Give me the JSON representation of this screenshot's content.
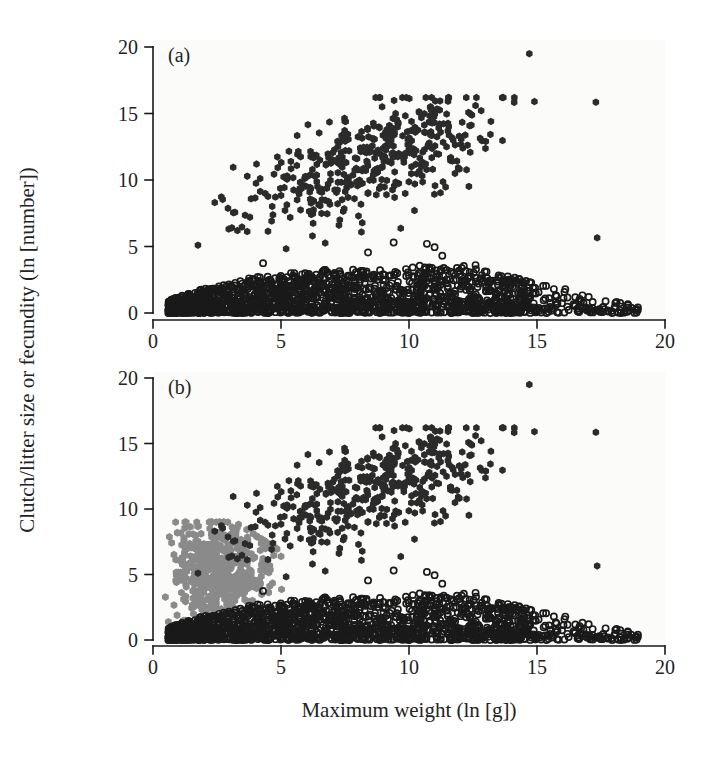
{
  "figure": {
    "background_color": "#ffffff",
    "panel_background_color": "#fbfbf9",
    "axis_color": "#1a1a1a",
    "width": 712,
    "height": 760
  },
  "axes": {
    "x_title": "Maximum weight (ln [g])",
    "y_title": "Clutch/litter size or fecundity (ln [number])",
    "x_ticks": [
      "0",
      "5",
      "10",
      "15",
      "20"
    ],
    "y_ticks": [
      "0",
      "5",
      "10",
      "15",
      "20"
    ],
    "x_tick_values": [
      0,
      5,
      10,
      15,
      20
    ],
    "y_tick_values": [
      0,
      5,
      10,
      15,
      20
    ],
    "xlim": [
      0,
      20
    ],
    "ylim": [
      0,
      20
    ],
    "grid": false
  },
  "panels": [
    {
      "tag": "(a)",
      "pixel_left": 153,
      "pixel_right": 665,
      "pixel_top": 47,
      "pixel_bottom": 313,
      "axis_y": 320,
      "series_names": [
        "filled-dark-fecundity",
        "open-circle-clutch"
      ]
    },
    {
      "tag": "(b)",
      "pixel_left": 153,
      "pixel_right": 665,
      "pixel_top": 378,
      "pixel_bottom": 640,
      "axis_y": 646,
      "series_names": [
        "filled-dark-fecundity",
        "open-circle-clutch",
        "gray-cluster"
      ]
    }
  ],
  "chart_data": {
    "type": "scatter",
    "title": "",
    "xlabel": "Maximum weight (ln [g])",
    "ylabel": "Clutch/litter size or fecundity (ln [number])",
    "xlim": [
      0,
      20
    ],
    "ylim": [
      0,
      20
    ],
    "xticks": [
      0,
      5,
      10,
      15,
      20
    ],
    "yticks": [
      0,
      5,
      10,
      15,
      20
    ],
    "grid": false,
    "legend_position": "none",
    "panels": [
      {
        "label": "(a)",
        "series": [
          {
            "name": "filled-dark-fecundity",
            "marker": "filled-hexagon",
            "color": "#2b2b2b",
            "size": 7.5,
            "count": 430,
            "description": "High-fecundity taxa: broad cloud rising from ln(weight) 1 to 15, ln(number) 4 to 16",
            "distribution": {
              "model": "linear-trend-with-scatter",
              "x_range": [
                1.0,
                14.9
              ],
              "x_density_peak": 9.0,
              "slope": 0.62,
              "intercept": 6.3,
              "y_scatter_sd": 2.0,
              "y_clip": [
                3.8,
                16.2
              ],
              "seed": 1701
            },
            "outliers": [
              {
                "x": 14.7,
                "y": 19.5
              },
              {
                "x": 17.3,
                "y": 15.85
              },
              {
                "x": 17.35,
                "y": 5.65
              },
              {
                "x": 14.9,
                "y": 15.9
              },
              {
                "x": 13.2,
                "y": 14.4
              },
              {
                "x": 12.6,
                "y": 15.6
              },
              {
                "x": 13.0,
                "y": 12.9
              },
              {
                "x": 12.1,
                "y": 12.4
              }
            ]
          },
          {
            "name": "open-circle-clutch",
            "marker": "open-circle",
            "color": "#1a1a1a",
            "size": 6.2,
            "count": 1700,
            "description": "Clutch/litter size band: dense near-saturated band from ln(weight) 0.6 to 19, ln(number) 0 to 4",
            "distribution": {
              "model": "saturating-band",
              "x_range": [
                0.6,
                19.0
              ],
              "x_density_peak": 5.5,
              "y_upper_curve": {
                "type": "log-saturating",
                "asymptote": 3.35,
                "rate": 0.3,
                "offset": 0.35
              },
              "y_lower": 0.0,
              "y_concentration": 0.62,
              "seed": 907
            },
            "sparse_tail": {
              "x_range": [
                12.5,
                19.0
              ],
              "y_range": [
                0.0,
                0.45
              ],
              "count": 62,
              "note": "row of open circles along the zero line out to x=19"
            },
            "upper_strays": [
              {
                "x": 9.4,
                "y": 5.3
              },
              {
                "x": 10.7,
                "y": 5.2
              },
              {
                "x": 11.0,
                "y": 4.95
              },
              {
                "x": 8.4,
                "y": 4.55
              },
              {
                "x": 11.3,
                "y": 4.3
              },
              {
                "x": 4.3,
                "y": 3.75
              },
              {
                "x": 12.6,
                "y": 3.6
              },
              {
                "x": 14.0,
                "y": 2.5
              },
              {
                "x": 12.9,
                "y": 2.45
              }
            ]
          }
        ]
      },
      {
        "label": "(b)",
        "series": [
          {
            "name": "filled-dark-fecundity",
            "marker": "filled-hexagon",
            "color": "#2b2b2b",
            "size": 7.5,
            "count": 430,
            "description": "Same high-fecundity cloud as panel (a)",
            "distribution": {
              "model": "linear-trend-with-scatter",
              "x_range": [
                1.0,
                14.9
              ],
              "x_density_peak": 9.0,
              "slope": 0.62,
              "intercept": 6.3,
              "y_scatter_sd": 2.0,
              "y_clip": [
                3.8,
                16.2
              ],
              "seed": 1701
            },
            "outliers": [
              {
                "x": 14.7,
                "y": 19.5
              },
              {
                "x": 17.3,
                "y": 15.85
              },
              {
                "x": 17.35,
                "y": 5.65
              },
              {
                "x": 14.9,
                "y": 15.9
              },
              {
                "x": 13.2,
                "y": 14.4
              },
              {
                "x": 12.6,
                "y": 15.6
              },
              {
                "x": 13.0,
                "y": 12.9
              },
              {
                "x": 12.1,
                "y": 12.4
              }
            ]
          },
          {
            "name": "gray-cluster",
            "marker": "filled-hexagon",
            "color": "#8a8a8a",
            "size": 7.8,
            "count": 520,
            "description": "Grey cluster unique to panel (b): small-bodied taxa, ln(weight) 0.4 to 5.2, ln(number) 0.5 to 9",
            "distribution": {
              "model": "dense-blob",
              "x_range": [
                0.4,
                5.2
              ],
              "x_density_peak": 2.1,
              "y_range": [
                0.5,
                9.0
              ],
              "y_density_peak": 5.2,
              "y_sd": 1.9,
              "upper_envelope_slope": 0.55,
              "seed": 4242
            }
          },
          {
            "name": "open-circle-clutch",
            "marker": "open-circle",
            "color": "#1a1a1a",
            "size": 6.2,
            "count": 1700,
            "description": "Same clutch/litter size band as panel (a)",
            "distribution": {
              "model": "saturating-band",
              "x_range": [
                0.6,
                19.0
              ],
              "x_density_peak": 5.5,
              "y_upper_curve": {
                "type": "log-saturating",
                "asymptote": 3.35,
                "rate": 0.3,
                "offset": 0.35
              },
              "y_lower": 0.0,
              "y_concentration": 0.62,
              "seed": 907
            },
            "sparse_tail": {
              "x_range": [
                12.5,
                19.0
              ],
              "y_range": [
                0.0,
                0.45
              ],
              "count": 62,
              "note": "row of open circles along the zero line out to x=19"
            },
            "upper_strays": [
              {
                "x": 9.4,
                "y": 5.3
              },
              {
                "x": 10.7,
                "y": 5.2
              },
              {
                "x": 11.0,
                "y": 4.95
              },
              {
                "x": 8.4,
                "y": 4.55
              },
              {
                "x": 11.3,
                "y": 4.3
              },
              {
                "x": 4.3,
                "y": 3.75
              },
              {
                "x": 12.6,
                "y": 3.6
              },
              {
                "x": 14.0,
                "y": 2.5
              },
              {
                "x": 12.9,
                "y": 2.45
              }
            ]
          }
        ]
      }
    ]
  }
}
